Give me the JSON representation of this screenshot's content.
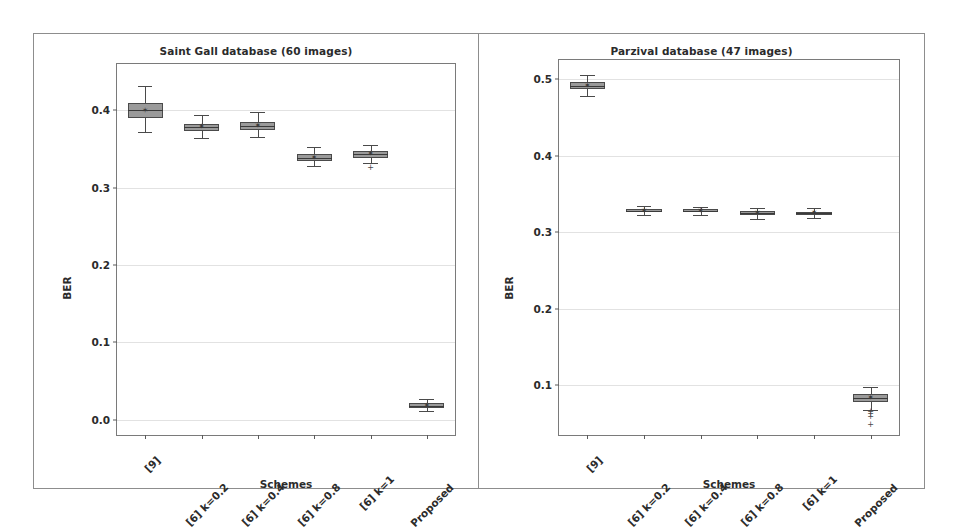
{
  "figure": {
    "background": "#ffffff",
    "border_color": "#8d8d8d",
    "box_fill": "#9a9a9a",
    "box_edge": "#4a4a4a",
    "grid_color": "#e2e2e2"
  },
  "chart_data": [
    {
      "type": "box",
      "title": "Saint Gall database (60 images)",
      "xlabel": "Schemes",
      "ylabel": "BER",
      "grid": true,
      "legend": "none",
      "ylim": [
        -0.02,
        0.46
      ],
      "yticks": [
        0.0,
        0.1,
        0.2,
        0.3,
        0.4
      ],
      "ytick_labels": [
        "0.0",
        "0.1",
        "0.2",
        "0.3",
        "0.4"
      ],
      "categories": [
        "[9]",
        "[6] k=0.2",
        "[6] k=0.4",
        "[6] k=0.8",
        "[6] k=1",
        "Proposed"
      ],
      "boxes": [
        {
          "category": "[9]",
          "whisker_low": 0.372,
          "q1": 0.39,
          "median": 0.4,
          "mean": 0.399,
          "q3": 0.409,
          "whisker_high": 0.432,
          "fliers": []
        },
        {
          "category": "[6] k=0.2",
          "whisker_low": 0.364,
          "q1": 0.373,
          "median": 0.378,
          "mean": 0.378,
          "q3": 0.383,
          "whisker_high": 0.394,
          "fliers": []
        },
        {
          "category": "[6] k=0.4",
          "whisker_low": 0.366,
          "q1": 0.375,
          "median": 0.38,
          "mean": 0.38,
          "q3": 0.385,
          "whisker_high": 0.398,
          "fliers": []
        },
        {
          "category": "[6] k=0.8",
          "whisker_low": 0.328,
          "q1": 0.335,
          "median": 0.339,
          "mean": 0.339,
          "q3": 0.343,
          "whisker_high": 0.352,
          "fliers": []
        },
        {
          "category": "[6] k=1",
          "whisker_low": 0.332,
          "q1": 0.339,
          "median": 0.343,
          "mean": 0.343,
          "q3": 0.347,
          "whisker_high": 0.355,
          "fliers": [
            0.326
          ]
        },
        {
          "category": "Proposed",
          "whisker_low": 0.011,
          "q1": 0.015,
          "median": 0.018,
          "mean": 0.018,
          "q3": 0.021,
          "whisker_high": 0.026,
          "fliers": []
        }
      ]
    },
    {
      "type": "box",
      "title": "Parzival database (47 images)",
      "xlabel": "Schemes",
      "ylabel": "BER",
      "grid": true,
      "legend": "none",
      "ylim": [
        0.035,
        0.525
      ],
      "yticks": [
        0.1,
        0.2,
        0.3,
        0.4,
        0.5
      ],
      "ytick_labels": [
        "0.1",
        "0.2",
        "0.3",
        "0.4",
        "0.5"
      ],
      "categories": [
        "[9]",
        "[6] k=0.2",
        "[6] k=0.4",
        "[6] k=0.8",
        "[6] k=1",
        "Proposed"
      ],
      "boxes": [
        {
          "category": "[9]",
          "whisker_low": 0.478,
          "q1": 0.487,
          "median": 0.491,
          "mean": 0.491,
          "q3": 0.496,
          "whisker_high": 0.505,
          "fliers": []
        },
        {
          "category": "[6] k=0.2",
          "whisker_low": 0.323,
          "q1": 0.326,
          "median": 0.328,
          "mean": 0.328,
          "q3": 0.33,
          "whisker_high": 0.334,
          "fliers": []
        },
        {
          "category": "[6] k=0.4",
          "whisker_low": 0.322,
          "q1": 0.326,
          "median": 0.328,
          "mean": 0.328,
          "q3": 0.33,
          "whisker_high": 0.333,
          "fliers": []
        },
        {
          "category": "[6] k=0.8",
          "whisker_low": 0.317,
          "q1": 0.323,
          "median": 0.325,
          "mean": 0.325,
          "q3": 0.328,
          "whisker_high": 0.332,
          "fliers": []
        },
        {
          "category": "[6] k=1",
          "whisker_low": 0.319,
          "q1": 0.322,
          "median": 0.325,
          "mean": 0.325,
          "q3": 0.327,
          "whisker_high": 0.331,
          "fliers": []
        },
        {
          "category": "Proposed",
          "whisker_low": 0.068,
          "q1": 0.078,
          "median": 0.083,
          "mean": 0.083,
          "q3": 0.088,
          "whisker_high": 0.098,
          "fliers": [
            0.065,
            0.062,
            0.059,
            0.048
          ]
        }
      ]
    }
  ]
}
